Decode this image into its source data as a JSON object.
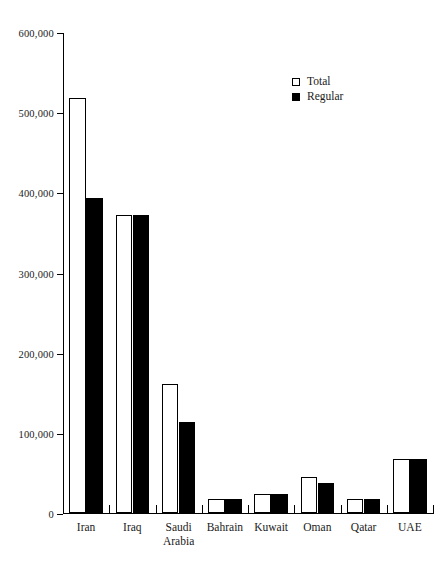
{
  "page_number": "",
  "chart_data": {
    "type": "bar",
    "title": "",
    "xlabel": "",
    "ylabel": "",
    "ylim": [
      0,
      600000
    ],
    "ytick_values": [
      0,
      100000,
      200000,
      300000,
      400000,
      500000,
      600000
    ],
    "ytick_labels": [
      "0",
      "100,000",
      "200,000",
      "300,000",
      "400,000",
      "500,000",
      "600,000"
    ],
    "grid": false,
    "legend_position": "top-right",
    "categories": [
      "Iran",
      "Iraq",
      "Saudi\nArabia",
      "Bahrain",
      "Kuwait",
      "Oman",
      "Qatar",
      "UAE"
    ],
    "series": [
      {
        "name": "Total",
        "color": "#ffffff",
        "values": [
          518000,
          372000,
          161000,
          17000,
          24000,
          45000,
          18000,
          68000
        ]
      },
      {
        "name": "Regular",
        "color": "#000000",
        "values": [
          393000,
          372000,
          113000,
          17000,
          24000,
          38000,
          18000,
          68000
        ]
      }
    ]
  },
  "legend": {
    "items": [
      {
        "label": "Total",
        "style": "outline"
      },
      {
        "label": "Regular",
        "style": "filled"
      }
    ]
  }
}
